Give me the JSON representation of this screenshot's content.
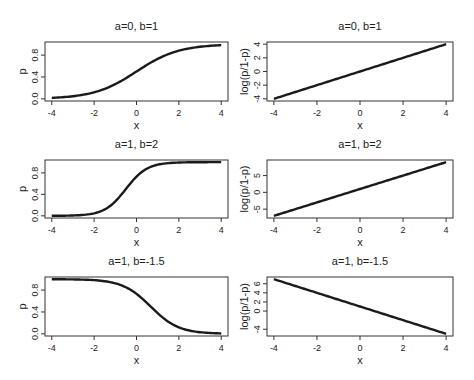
{
  "figure": {
    "colors": {
      "line": "#1a1a1a",
      "axis": "#333333",
      "text": "#222222",
      "background": "#ffffff"
    }
  },
  "chart_data": [
    {
      "type": "line",
      "panel": "row1-left",
      "title": "a=0, b=1",
      "xlabel": "x",
      "ylabel": "p",
      "params": {
        "a": 0,
        "b": 1
      },
      "function": "logistic",
      "xlim": [
        -4,
        4
      ],
      "ylim": [
        0,
        1
      ],
      "x_ticks": [
        "-4",
        "-2",
        "0",
        "2",
        "4"
      ],
      "y_ticks": [
        "0.0",
        "0.4",
        "0.8"
      ],
      "x": [
        -4,
        -3,
        -2,
        -1,
        0,
        1,
        2,
        3,
        4
      ],
      "values": [
        0.018,
        0.047,
        0.119,
        0.269,
        0.5,
        0.731,
        0.881,
        0.953,
        0.982
      ]
    },
    {
      "type": "line",
      "panel": "row1-right",
      "title": "a=0, b=1",
      "xlabel": "x",
      "ylabel": "log(p/1-p)",
      "params": {
        "a": 0,
        "b": 1
      },
      "function": "logit",
      "xlim": [
        -4,
        4
      ],
      "ylim": [
        -4,
        4
      ],
      "x_ticks": [
        "-4",
        "-2",
        "0",
        "2",
        "4"
      ],
      "y_ticks": [
        "-4",
        "-2",
        "0",
        "2",
        "4"
      ],
      "x": [
        -4,
        4
      ],
      "values": [
        -4,
        4
      ]
    },
    {
      "type": "line",
      "panel": "row2-left",
      "title": "a=1, b=2",
      "xlabel": "x",
      "ylabel": "p",
      "params": {
        "a": 1,
        "b": 2
      },
      "function": "logistic",
      "xlim": [
        -4,
        4
      ],
      "ylim": [
        0,
        1
      ],
      "x_ticks": [
        "-4",
        "-2",
        "0",
        "2",
        "4"
      ],
      "y_ticks": [
        "0.0",
        "0.4",
        "0.8"
      ],
      "x": [
        -4,
        -3,
        -2,
        -1,
        -0.5,
        0,
        1,
        2,
        3,
        4
      ],
      "values": [
        0.001,
        0.007,
        0.047,
        0.269,
        0.5,
        0.731,
        0.953,
        0.993,
        0.999,
        1.0
      ]
    },
    {
      "type": "line",
      "panel": "row2-right",
      "title": "a=1, b=2",
      "xlabel": "x",
      "ylabel": "log(p/1-p)",
      "params": {
        "a": 1,
        "b": 2
      },
      "function": "logit",
      "xlim": [
        -4,
        4
      ],
      "ylim": [
        -7,
        9
      ],
      "x_ticks": [
        "-4",
        "-2",
        "0",
        "2",
        "4"
      ],
      "y_ticks": [
        "-5",
        "0",
        "5"
      ],
      "x": [
        -4,
        4
      ],
      "values": [
        -7,
        9
      ]
    },
    {
      "type": "line",
      "panel": "row3-left",
      "title": "a=1, b=-1.5",
      "xlabel": "x",
      "ylabel": "p",
      "params": {
        "a": 1,
        "b": -1.5
      },
      "function": "logistic",
      "xlim": [
        -4,
        4
      ],
      "ylim": [
        0,
        1
      ],
      "x_ticks": [
        "-4",
        "-2",
        "0",
        "2",
        "4"
      ],
      "y_ticks": [
        "0.0",
        "0.4",
        "0.8"
      ],
      "x": [
        -4,
        -3,
        -2,
        -1,
        0,
        0.667,
        1,
        2,
        3,
        4
      ],
      "values": [
        0.999,
        0.996,
        0.982,
        0.924,
        0.731,
        0.5,
        0.378,
        0.119,
        0.029,
        0.007
      ]
    },
    {
      "type": "line",
      "panel": "row3-right",
      "title": "a=1, b=-1.5",
      "xlabel": "x",
      "ylabel": "log(p/1-p)",
      "params": {
        "a": 1,
        "b": -1.5
      },
      "function": "logit",
      "xlim": [
        -4,
        4
      ],
      "ylim": [
        -5,
        7
      ],
      "x_ticks": [
        "-4",
        "-2",
        "0",
        "2",
        "4"
      ],
      "y_ticks": [
        "-4",
        "0",
        "2",
        "4",
        "6"
      ],
      "x": [
        -4,
        4
      ],
      "values": [
        7,
        -5
      ]
    }
  ]
}
